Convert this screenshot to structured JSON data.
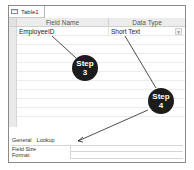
{
  "window": {
    "tab_label": "Table1",
    "tab_icon": "table-icon"
  },
  "design_grid": {
    "columns": [
      "Field Name",
      "Data Type"
    ],
    "rows": [
      {
        "field_name": "EmployeeID",
        "data_type": "Short Text",
        "dropdown_icon": "chevron-down-icon"
      }
    ]
  },
  "field_properties": {
    "tabs": [
      "General",
      "Lookup"
    ],
    "rows": [
      {
        "label": "Field Size",
        "value": ""
      },
      {
        "label": "Format",
        "value": ""
      }
    ]
  },
  "callouts": [
    {
      "label_line1": "Step",
      "label_line2": "3"
    },
    {
      "label_line1": "Step",
      "label_line2": "4"
    }
  ],
  "colors": {
    "callout_bg": "#1c1c1c",
    "callout_text": "#ffffff",
    "header_bg": "#ececec"
  }
}
